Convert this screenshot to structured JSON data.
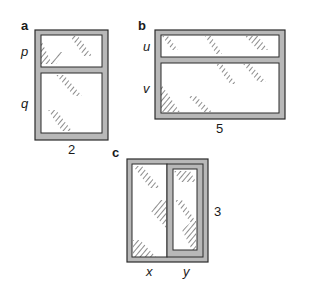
{
  "figures": [
    {
      "id": "a",
      "panel_label": "a",
      "orientation": "horizontal-split",
      "side_labels": [
        "p",
        "q"
      ],
      "bottom_label": "2"
    },
    {
      "id": "b",
      "panel_label": "b",
      "orientation": "horizontal-split",
      "side_labels": [
        "u",
        "v"
      ],
      "bottom_label": "5"
    },
    {
      "id": "c",
      "panel_label": "c",
      "orientation": "vertical-split",
      "bottom_labels": [
        "x",
        "y"
      ],
      "right_label": "3"
    }
  ],
  "colors": {
    "frame_fill": "#b8b8b8",
    "frame_stroke": "#2a2a2a",
    "glass": "#ffffff",
    "hatch": "#1a1a1a"
  }
}
